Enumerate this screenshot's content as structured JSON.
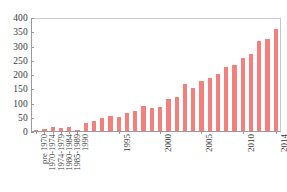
{
  "chart_data": {
    "type": "bar",
    "title": "",
    "subtitle": "",
    "xlabel": "",
    "ylabel": "",
    "ylim": [
      0,
      400
    ],
    "ytick_values": [
      0,
      50,
      100,
      150,
      200,
      250,
      300,
      350,
      400
    ],
    "ytick_labels": [
      "0",
      "50",
      "100",
      "150",
      "200",
      "250",
      "300",
      "350",
      "400"
    ],
    "grid": false,
    "legend": null,
    "bar_color": "#f4807e",
    "axis_color": "#9a9a9a",
    "categories": [
      "pre 1970",
      "1970-1974",
      "1974-1979",
      "1980-1984",
      "1985-1989",
      "1990",
      "1991",
      "1992",
      "1993",
      "1994",
      "1995",
      "1996",
      "1997",
      "1998",
      "1999",
      "2000",
      "2001",
      "2002",
      "2003",
      "2004",
      "2005",
      "2006",
      "2007",
      "2008",
      "2009",
      "2010",
      "2011",
      "2012",
      "2013",
      "2014"
    ],
    "values": [
      2,
      6,
      13,
      11,
      13,
      2,
      30,
      37,
      45,
      52,
      51,
      66,
      71,
      89,
      82,
      86,
      115,
      121,
      167,
      154,
      179,
      190,
      205,
      229,
      235,
      259,
      274,
      322,
      329,
      365
    ],
    "xtick_labels_shown": [
      "pre 1970",
      "1970-1974",
      "1974-1979",
      "1980-1984",
      "1985-1989",
      "1990",
      "1995",
      "2000",
      "2005",
      "2010",
      "2014"
    ],
    "xtick_indices_shown": [
      0,
      1,
      2,
      3,
      4,
      5,
      10,
      15,
      20,
      25,
      29
    ]
  }
}
